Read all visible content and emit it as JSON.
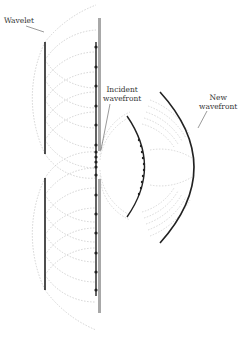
{
  "diagram": {
    "type": "huygens-wavelet-diffraction",
    "labels": {
      "wavelet": "Wavelet",
      "incident_line1": "Incident",
      "incident_line2": "wavefront",
      "new_line1": "New",
      "new_line2": "wavefront"
    },
    "colors": {
      "wavefront": "#222222",
      "barrier": "#a8a8a8",
      "wavelet": "#c8c8c8",
      "leader": "#555555",
      "text": "#333333"
    },
    "left_wavefronts": [
      {
        "x": 45,
        "y1": 42,
        "y2": 154
      },
      {
        "x": 45,
        "y1": 178,
        "y2": 290
      }
    ],
    "barrier_segments": [
      {
        "x": 99,
        "y1": 18,
        "y2": 151
      },
      {
        "x": 99,
        "y1": 179,
        "y2": 313
      }
    ],
    "incident_wavefront": {
      "x": 96,
      "y1": 42,
      "y2": 296
    },
    "incident_dots_y": [
      47,
      67,
      86,
      106,
      125,
      145,
      152,
      157,
      162,
      167,
      175,
      195,
      214,
      233,
      253,
      272,
      290
    ],
    "middle_arc": {
      "start": [
        127,
        116
      ],
      "apex": [
        147,
        167
      ],
      "end": [
        127,
        217
      ]
    },
    "new_wavefront": {
      "start": [
        160,
        92
      ],
      "apex": [
        196,
        167
      ],
      "end": [
        160,
        243
      ]
    }
  }
}
